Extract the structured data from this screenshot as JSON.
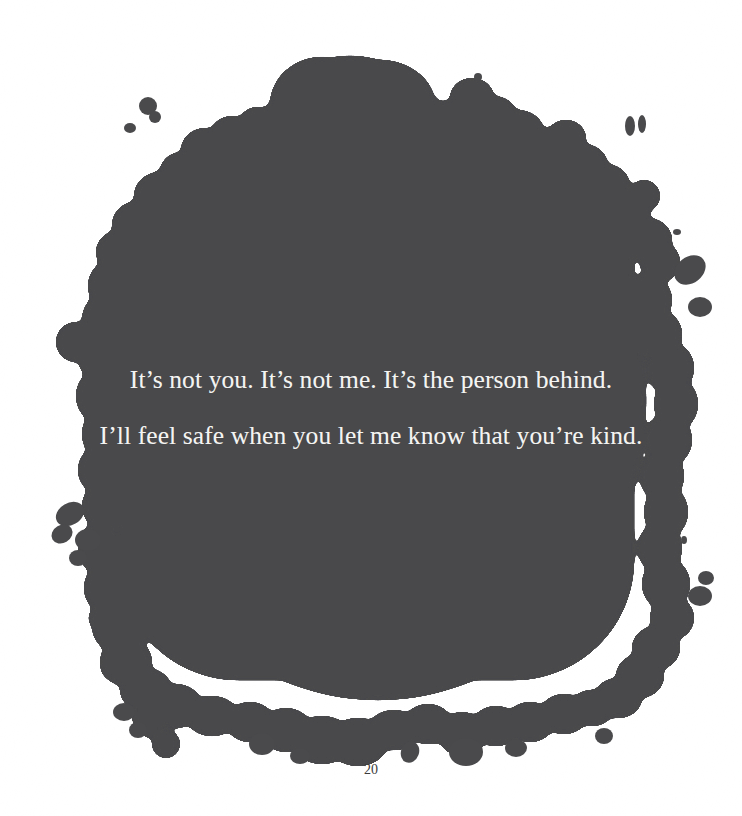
{
  "page": {
    "background_color": "#ffffff",
    "page_number": "20"
  },
  "illustration": {
    "name": "ink-blot-shape",
    "fill_color": "#4a4a4c",
    "description": "large irregular ink blot / paint splatter covering most of the page"
  },
  "poem": {
    "lines": [
      "It’s not you. It’s not me. It’s the person behind.",
      "I’ll feel safe when you let me know that you’re kind."
    ],
    "text_color": "#f4f4f2"
  }
}
